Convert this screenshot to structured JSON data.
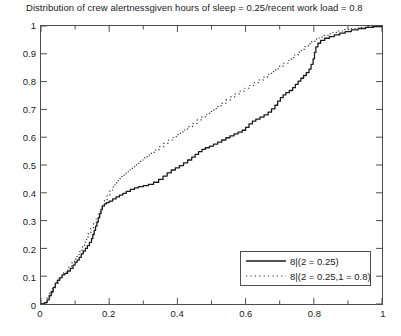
{
  "chart_data": {
    "type": "line",
    "title": "Distribution of crew alertnessgiven hours of sleep = 0.25/recent work load = 0.8",
    "xlabel": "",
    "ylabel": "",
    "xlim": [
      0,
      1
    ],
    "ylim": [
      0,
      1
    ],
    "grid": false,
    "legend_position": "lower right",
    "xticks": [
      0,
      0.2,
      0.4,
      0.6,
      0.8,
      1
    ],
    "xtick_labels": [
      "0",
      "0.2",
      "0.4",
      "0.6",
      "0.8",
      "1"
    ],
    "yticks": [
      0,
      0.1,
      0.2,
      0.3,
      0.4,
      0.5,
      0.6,
      0.7,
      0.8,
      0.9,
      1
    ],
    "ytick_labels": [
      "0",
      "0.1",
      "0.2",
      "0.3",
      "0.4",
      "0.5",
      "0.6",
      "0.7",
      "0.8",
      "0.9",
      "1"
    ],
    "series": [
      {
        "name": "8|(2 = 0.25)",
        "style": "solid",
        "color": "#1a1a1a",
        "points": [
          [
            0.0,
            0.0
          ],
          [
            0.01,
            0.005
          ],
          [
            0.018,
            0.015
          ],
          [
            0.024,
            0.03
          ],
          [
            0.03,
            0.045
          ],
          [
            0.036,
            0.06
          ],
          [
            0.042,
            0.075
          ],
          [
            0.048,
            0.085
          ],
          [
            0.055,
            0.095
          ],
          [
            0.062,
            0.105
          ],
          [
            0.07,
            0.11
          ],
          [
            0.078,
            0.118
          ],
          [
            0.086,
            0.128
          ],
          [
            0.094,
            0.14
          ],
          [
            0.1,
            0.15
          ],
          [
            0.106,
            0.158
          ],
          [
            0.112,
            0.168
          ],
          [
            0.118,
            0.18
          ],
          [
            0.124,
            0.19
          ],
          [
            0.13,
            0.2
          ],
          [
            0.136,
            0.21
          ],
          [
            0.142,
            0.222
          ],
          [
            0.148,
            0.235
          ],
          [
            0.152,
            0.25
          ],
          [
            0.156,
            0.265
          ],
          [
            0.16,
            0.28
          ],
          [
            0.164,
            0.295
          ],
          [
            0.168,
            0.31
          ],
          [
            0.172,
            0.325
          ],
          [
            0.176,
            0.34
          ],
          [
            0.18,
            0.352
          ],
          [
            0.186,
            0.36
          ],
          [
            0.192,
            0.365
          ],
          [
            0.2,
            0.37
          ],
          [
            0.21,
            0.378
          ],
          [
            0.22,
            0.385
          ],
          [
            0.23,
            0.392
          ],
          [
            0.24,
            0.398
          ],
          [
            0.25,
            0.405
          ],
          [
            0.262,
            0.412
          ],
          [
            0.274,
            0.418
          ],
          [
            0.286,
            0.422
          ],
          [
            0.3,
            0.426
          ],
          [
            0.315,
            0.43
          ],
          [
            0.33,
            0.438
          ],
          [
            0.345,
            0.448
          ],
          [
            0.358,
            0.46
          ],
          [
            0.37,
            0.472
          ],
          [
            0.382,
            0.482
          ],
          [
            0.394,
            0.49
          ],
          [
            0.406,
            0.498
          ],
          [
            0.418,
            0.508
          ],
          [
            0.43,
            0.518
          ],
          [
            0.442,
            0.528
          ],
          [
            0.452,
            0.538
          ],
          [
            0.462,
            0.548
          ],
          [
            0.472,
            0.556
          ],
          [
            0.482,
            0.562
          ],
          [
            0.494,
            0.568
          ],
          [
            0.506,
            0.575
          ],
          [
            0.518,
            0.582
          ],
          [
            0.53,
            0.59
          ],
          [
            0.542,
            0.598
          ],
          [
            0.554,
            0.605
          ],
          [
            0.566,
            0.612
          ],
          [
            0.578,
            0.618
          ],
          [
            0.59,
            0.625
          ],
          [
            0.6,
            0.635
          ],
          [
            0.61,
            0.648
          ],
          [
            0.62,
            0.658
          ],
          [
            0.63,
            0.665
          ],
          [
            0.642,
            0.672
          ],
          [
            0.654,
            0.68
          ],
          [
            0.666,
            0.69
          ],
          [
            0.676,
            0.702
          ],
          [
            0.686,
            0.715
          ],
          [
            0.694,
            0.73
          ],
          [
            0.702,
            0.742
          ],
          [
            0.71,
            0.752
          ],
          [
            0.718,
            0.76
          ],
          [
            0.728,
            0.768
          ],
          [
            0.738,
            0.778
          ],
          [
            0.746,
            0.79
          ],
          [
            0.754,
            0.802
          ],
          [
            0.762,
            0.812
          ],
          [
            0.77,
            0.822
          ],
          [
            0.778,
            0.832
          ],
          [
            0.786,
            0.845
          ],
          [
            0.792,
            0.862
          ],
          [
            0.798,
            0.882
          ],
          [
            0.802,
            0.905
          ],
          [
            0.806,
            0.925
          ],
          [
            0.812,
            0.938
          ],
          [
            0.82,
            0.948
          ],
          [
            0.832,
            0.956
          ],
          [
            0.846,
            0.962
          ],
          [
            0.86,
            0.968
          ],
          [
            0.876,
            0.974
          ],
          [
            0.892,
            0.98
          ],
          [
            0.91,
            0.986
          ],
          [
            0.93,
            0.991
          ],
          [
            0.952,
            0.995
          ],
          [
            0.975,
            0.998
          ],
          [
            1.0,
            1.0
          ]
        ]
      },
      {
        "name": "8|(2 = 0.25,1 = 0.8)",
        "style": "dotted",
        "color": "#333333",
        "points": [
          [
            0.0,
            0.0
          ],
          [
            0.01,
            0.008
          ],
          [
            0.018,
            0.022
          ],
          [
            0.026,
            0.04
          ],
          [
            0.034,
            0.058
          ],
          [
            0.042,
            0.075
          ],
          [
            0.05,
            0.09
          ],
          [
            0.058,
            0.102
          ],
          [
            0.066,
            0.112
          ],
          [
            0.074,
            0.122
          ],
          [
            0.082,
            0.134
          ],
          [
            0.09,
            0.148
          ],
          [
            0.098,
            0.162
          ],
          [
            0.106,
            0.178
          ],
          [
            0.114,
            0.194
          ],
          [
            0.122,
            0.212
          ],
          [
            0.13,
            0.232
          ],
          [
            0.138,
            0.252
          ],
          [
            0.146,
            0.272
          ],
          [
            0.154,
            0.292
          ],
          [
            0.162,
            0.312
          ],
          [
            0.17,
            0.332
          ],
          [
            0.178,
            0.352
          ],
          [
            0.186,
            0.372
          ],
          [
            0.194,
            0.392
          ],
          [
            0.202,
            0.41
          ],
          [
            0.212,
            0.428
          ],
          [
            0.222,
            0.444
          ],
          [
            0.232,
            0.458
          ],
          [
            0.244,
            0.47
          ],
          [
            0.256,
            0.482
          ],
          [
            0.268,
            0.494
          ],
          [
            0.28,
            0.506
          ],
          [
            0.292,
            0.518
          ],
          [
            0.304,
            0.53
          ],
          [
            0.318,
            0.542
          ],
          [
            0.332,
            0.554
          ],
          [
            0.346,
            0.566
          ],
          [
            0.36,
            0.578
          ],
          [
            0.374,
            0.59
          ],
          [
            0.388,
            0.602
          ],
          [
            0.402,
            0.614
          ],
          [
            0.416,
            0.626
          ],
          [
            0.43,
            0.638
          ],
          [
            0.444,
            0.65
          ],
          [
            0.458,
            0.662
          ],
          [
            0.472,
            0.674
          ],
          [
            0.486,
            0.686
          ],
          [
            0.5,
            0.698
          ],
          [
            0.514,
            0.71
          ],
          [
            0.528,
            0.722
          ],
          [
            0.542,
            0.734
          ],
          [
            0.556,
            0.745
          ],
          [
            0.57,
            0.756
          ],
          [
            0.584,
            0.766
          ],
          [
            0.598,
            0.776
          ],
          [
            0.612,
            0.786
          ],
          [
            0.626,
            0.796
          ],
          [
            0.64,
            0.806
          ],
          [
            0.652,
            0.816
          ],
          [
            0.664,
            0.826
          ],
          [
            0.676,
            0.836
          ],
          [
            0.688,
            0.846
          ],
          [
            0.7,
            0.856
          ],
          [
            0.712,
            0.866
          ],
          [
            0.724,
            0.876
          ],
          [
            0.734,
            0.886
          ],
          [
            0.744,
            0.896
          ],
          [
            0.754,
            0.906
          ],
          [
            0.764,
            0.916
          ],
          [
            0.774,
            0.926
          ],
          [
            0.784,
            0.936
          ],
          [
            0.794,
            0.945
          ],
          [
            0.804,
            0.953
          ],
          [
            0.816,
            0.96
          ],
          [
            0.828,
            0.966
          ],
          [
            0.842,
            0.972
          ],
          [
            0.856,
            0.977
          ],
          [
            0.872,
            0.982
          ],
          [
            0.89,
            0.987
          ],
          [
            0.91,
            0.991
          ],
          [
            0.932,
            0.995
          ],
          [
            0.958,
            0.998
          ],
          [
            1.0,
            1.0
          ]
        ]
      }
    ]
  }
}
